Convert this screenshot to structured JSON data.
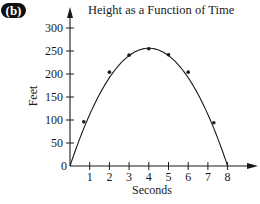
{
  "panel_label": "(b)",
  "chart_data": {
    "type": "line",
    "title": "Height as a Function of Time",
    "xlabel": "Seconds",
    "ylabel": "Feet",
    "xlim": [
      0,
      8.5
    ],
    "ylim": [
      0,
      320
    ],
    "x_ticks": [
      1,
      2,
      3,
      4,
      5,
      6,
      7,
      8
    ],
    "y_ticks": [
      0,
      50,
      100,
      150,
      200,
      250,
      300
    ],
    "grid": false,
    "legend": null,
    "curve": {
      "name": "height",
      "formula_shape": "downward parabola",
      "x": [
        0,
        8
      ],
      "peak": {
        "x": 4,
        "y": 256
      }
    },
    "points": [
      {
        "x": 0.7,
        "y": 96
      },
      {
        "x": 2,
        "y": 204
      },
      {
        "x": 3,
        "y": 241
      },
      {
        "x": 4,
        "y": 255
      },
      {
        "x": 5,
        "y": 242
      },
      {
        "x": 6,
        "y": 204
      },
      {
        "x": 7.3,
        "y": 94
      }
    ]
  },
  "colors": {
    "ink": "#1a1a1a",
    "background": "#ffffff",
    "label_bg": "#111111",
    "label_text": "#ffffff"
  }
}
